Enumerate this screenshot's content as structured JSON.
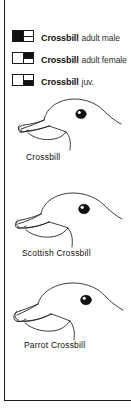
{
  "plate": {
    "title": "Crossbill identification plate"
  },
  "legend": {
    "rows": [
      {
        "swatch": "black-left-half",
        "species": "Crossbill",
        "qualifier": "adult male"
      },
      {
        "swatch": "black-right-top",
        "species": "Crossbill",
        "qualifier": "adult female"
      },
      {
        "swatch": "black-right-bottom",
        "species": "Crossbill",
        "qualifier": "juv."
      }
    ]
  },
  "figures": [
    {
      "caption": "Crossbill",
      "art": "crossbill-head-profile"
    },
    {
      "caption": "Scottish Crossbill",
      "art": "scottish-crossbill-head-profile"
    },
    {
      "caption": "Parrot Crossbill",
      "art": "parrot-crossbill-head-profile"
    }
  ],
  "colors": {
    "ink": "#111111",
    "rule": "#1b1b1b",
    "paper": "#ffffff"
  }
}
